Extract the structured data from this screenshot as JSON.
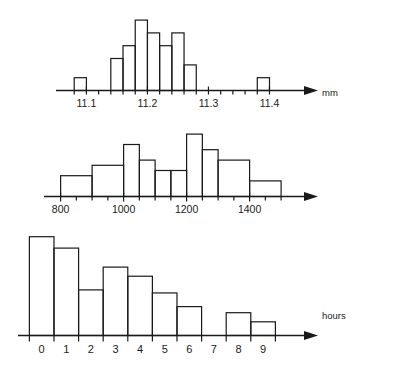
{
  "page": {
    "background": "#ffffff",
    "ink": "#1a1a1a",
    "width": 400,
    "height": 373
  },
  "charts": [
    {
      "id": "histogram-mm",
      "name": "histogram-measurement-mm",
      "axis_label": "mm",
      "tick_labels": [
        "11.1",
        "11.2",
        "11.3",
        "11.4"
      ],
      "tick_label_values": [
        11.1,
        11.2,
        11.3,
        11.4
      ]
    },
    {
      "id": "histogram-hours",
      "name": "histogram-lifetime-hours",
      "axis_label": "hours",
      "tick_labels": [
        "800",
        "1000",
        "1200",
        "1400"
      ],
      "tick_label_values": [
        800,
        1000,
        1200,
        1400
      ]
    },
    {
      "id": "histogram-errors",
      "name": "histogram-errors-per-day",
      "axis_label": "no of errors\nper day",
      "tick_labels": [
        "0",
        "1",
        "2",
        "3",
        "4",
        "5",
        "6",
        "7",
        "8",
        "9"
      ],
      "tick_label_values": [
        0,
        1,
        2,
        3,
        4,
        5,
        6,
        7,
        8,
        9
      ]
    }
  ],
  "chart_data": [
    {
      "type": "bar",
      "id": "histogram-mm",
      "title": "",
      "xlabel": "mm",
      "ylabel": "",
      "grid": false,
      "legend": "none",
      "xlim": [
        11.06,
        11.45
      ],
      "ylim": [
        0,
        12
      ],
      "xtick_labels": [
        "11.1",
        "11.2",
        "11.3",
        "11.4"
      ],
      "xticks": [
        11.1,
        11.2,
        11.3,
        11.4
      ],
      "minor_tick_step": 0.02,
      "bin_width": 0.02,
      "bins": [
        {
          "x0": 11.08,
          "x1": 11.1,
          "height": 2
        },
        {
          "x0": 11.14,
          "x1": 11.16,
          "height": 5
        },
        {
          "x0": 11.16,
          "x1": 11.18,
          "height": 7
        },
        {
          "x0": 11.18,
          "x1": 11.2,
          "height": 11
        },
        {
          "x0": 11.2,
          "x1": 11.22,
          "height": 9
        },
        {
          "x0": 11.22,
          "x1": 11.24,
          "height": 7
        },
        {
          "x0": 11.24,
          "x1": 11.26,
          "height": 9
        },
        {
          "x0": 11.26,
          "x1": 11.28,
          "height": 4
        },
        {
          "x0": 11.38,
          "x1": 11.4,
          "height": 2
        }
      ],
      "categories": [
        "11.08-11.10",
        "11.14-11.16",
        "11.16-11.18",
        "11.18-11.20",
        "11.20-11.22",
        "11.22-11.24",
        "11.24-11.26",
        "11.26-11.28",
        "11.38-11.40"
      ],
      "values": [
        2,
        5,
        7,
        11,
        9,
        7,
        9,
        4,
        2
      ]
    },
    {
      "type": "bar",
      "id": "histogram-hours",
      "title": "",
      "xlabel": "hours",
      "ylabel": "",
      "grid": false,
      "legend": "none",
      "xlim": [
        760,
        1560
      ],
      "ylim": [
        0,
        12
      ],
      "xtick_labels": [
        "800",
        "1000",
        "1200",
        "1400"
      ],
      "xticks": [
        800,
        1000,
        1200,
        1400
      ],
      "minor_tick_step": 50,
      "bins": [
        {
          "x0": 800,
          "x1": 900,
          "height": 4
        },
        {
          "x0": 900,
          "x1": 1000,
          "height": 6
        },
        {
          "x0": 1000,
          "x1": 1050,
          "height": 10
        },
        {
          "x0": 1050,
          "x1": 1100,
          "height": 7
        },
        {
          "x0": 1100,
          "x1": 1150,
          "height": 5
        },
        {
          "x0": 1150,
          "x1": 1200,
          "height": 5
        },
        {
          "x0": 1200,
          "x1": 1250,
          "height": 12
        },
        {
          "x0": 1250,
          "x1": 1300,
          "height": 9
        },
        {
          "x0": 1300,
          "x1": 1400,
          "height": 7
        },
        {
          "x0": 1400,
          "x1": 1500,
          "height": 3
        }
      ],
      "categories": [
        "800-900",
        "900-1000",
        "1000-1050",
        "1050-1100",
        "1100-1150",
        "1150-1200",
        "1200-1250",
        "1250-1300",
        "1300-1400",
        "1400-1500"
      ],
      "values": [
        4,
        6,
        10,
        7,
        5,
        5,
        12,
        9,
        7,
        3
      ]
    },
    {
      "type": "bar",
      "id": "histogram-errors",
      "title": "",
      "xlabel": "no of errors per day",
      "ylabel": "",
      "grid": false,
      "legend": "none",
      "xlim": [
        -0.8,
        10.5
      ],
      "ylim": [
        0,
        13
      ],
      "xtick_labels": [
        "0",
        "1",
        "2",
        "3",
        "4",
        "5",
        "6",
        "7",
        "8",
        "9"
      ],
      "xticks": [
        0,
        1,
        2,
        3,
        4,
        5,
        6,
        7,
        8,
        9
      ],
      "bin_width": 1,
      "bins": [
        {
          "label": "0",
          "height": 13
        },
        {
          "label": "1",
          "height": 11.5
        },
        {
          "label": "2",
          "height": 6
        },
        {
          "label": "3",
          "height": 9
        },
        {
          "label": "4",
          "height": 7.8
        },
        {
          "label": "5",
          "height": 5.6
        },
        {
          "label": "6",
          "height": 3.8
        },
        {
          "label": "7",
          "height": 0
        },
        {
          "label": "8",
          "height": 3
        },
        {
          "label": "9",
          "height": 1.8
        }
      ],
      "categories": [
        "0",
        "1",
        "2",
        "3",
        "4",
        "5",
        "6",
        "7",
        "8",
        "9"
      ],
      "values": [
        13,
        11.5,
        6,
        9,
        7.8,
        5.6,
        3.8,
        0,
        3,
        1.8
      ]
    }
  ]
}
